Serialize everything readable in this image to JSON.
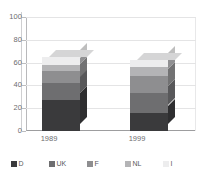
{
  "chart_data": {
    "type": "bar",
    "subtype": "stacked-column-3d",
    "title": "",
    "xlabel": "",
    "ylabel": "",
    "categories": [
      "1989",
      "1999"
    ],
    "ylim": [
      0,
      100
    ],
    "yticks": [
      0,
      20,
      40,
      60,
      80,
      100
    ],
    "ytick_labels": [
      "0",
      "20",
      "40",
      "60",
      "80",
      "100"
    ],
    "grid": true,
    "legend_position": "bottom",
    "series": [
      {
        "name": "D",
        "color": "#3a3a3c",
        "values": [
          27,
          16
        ]
      },
      {
        "name": "UK",
        "color": "#6e6e70",
        "values": [
          15,
          17
        ]
      },
      {
        "name": "F",
        "color": "#8e8e90",
        "values": [
          11,
          15
        ]
      },
      {
        "name": "NL",
        "color": "#b4b4b6",
        "values": [
          5,
          8
        ]
      },
      {
        "name": "I",
        "color": "#ededee",
        "values": [
          7,
          6
        ]
      }
    ],
    "totals": [
      65,
      62
    ]
  },
  "legend": {
    "items": [
      {
        "label": "D"
      },
      {
        "label": "UK"
      },
      {
        "label": "F"
      },
      {
        "label": "NL"
      },
      {
        "label": "I"
      }
    ]
  },
  "axis": {
    "y_labels": [
      "100",
      "80",
      "60",
      "40",
      "20",
      "0"
    ],
    "x_labels": [
      "1989",
      "1999"
    ]
  }
}
